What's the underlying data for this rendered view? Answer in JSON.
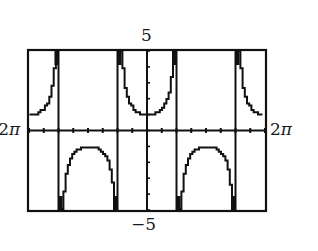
{
  "chart_data": {
    "type": "line",
    "function": "y = sec(x)",
    "title": "",
    "xlabel": "",
    "ylabel": "",
    "xlim": [
      -6.2832,
      6.2832
    ],
    "ylim": [
      -5,
      5
    ],
    "x_tick_step": 1.5708,
    "y_tick_step": 1,
    "grid": false,
    "window_labels": {
      "xmin": "−2π",
      "xmax": "2π",
      "ymin": "−5",
      "ymax": "5"
    },
    "asymptotes": [
      -4.7124,
      -1.5708,
      1.5708,
      4.7124
    ],
    "branches": [
      {
        "x_range": [
          -6.2832,
          -4.7124
        ],
        "direction": "up",
        "extremum": {
          "x": -6.2832,
          "y": 1
        }
      },
      {
        "x_range": [
          -4.7124,
          -1.5708
        ],
        "direction": "down",
        "extremum": {
          "x": -3.1416,
          "y": -1
        }
      },
      {
        "x_range": [
          -1.5708,
          1.5708
        ],
        "direction": "up",
        "extremum": {
          "x": 0,
          "y": 1
        }
      },
      {
        "x_range": [
          1.5708,
          4.7124
        ],
        "direction": "down",
        "extremum": {
          "x": 3.1416,
          "y": -1
        }
      },
      {
        "x_range": [
          4.7124,
          6.2832
        ],
        "direction": "up",
        "extremum": {
          "x": 6.2832,
          "y": 1
        }
      }
    ],
    "style": {
      "line_color": "#111111",
      "background": "#ffffff",
      "frame_color": "#111111"
    }
  },
  "labels": {
    "ymax": "5",
    "ymin": "−5",
    "xmin_sign": "−",
    "xmin_num": "2",
    "xmin_pi": "π",
    "xmax_num": "2",
    "xmax_pi": "π"
  }
}
